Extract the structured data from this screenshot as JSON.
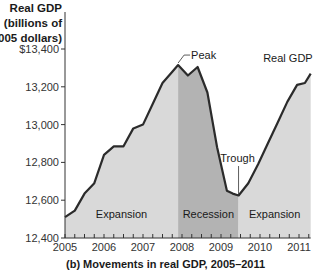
{
  "chart_data": {
    "type": "area",
    "title": "",
    "caption": "(b) Movements in real GDP, 2005–2011",
    "ylabel": [
      "Real GDP",
      "(billions of",
      "2005 dollars)"
    ],
    "xlabel": "",
    "ylim": [
      12400,
      13400
    ],
    "xlim": [
      2005,
      2011.3
    ],
    "yticks": [
      {
        "value": 13400,
        "label": "$13,400"
      },
      {
        "value": 13200,
        "label": "13,200"
      },
      {
        "value": 13000,
        "label": "13,000"
      },
      {
        "value": 12800,
        "label": "12,800"
      },
      {
        "value": 12600,
        "label": "12,600"
      },
      {
        "value": 12400,
        "label": "12,400"
      }
    ],
    "xticks": [
      {
        "value": 2005,
        "label": "2005"
      },
      {
        "value": 2006,
        "label": "2006"
      },
      {
        "value": 2007,
        "label": "2007"
      },
      {
        "value": 2008,
        "label": "2008"
      },
      {
        "value": 2009,
        "label": "2009"
      },
      {
        "value": 2010,
        "label": "2010"
      },
      {
        "value": 2011,
        "label": "2011"
      }
    ],
    "grid": false,
    "series": [
      {
        "name": "Real GDP",
        "x": [
          2005.0,
          2005.25,
          2005.5,
          2005.75,
          2006.0,
          2006.25,
          2006.5,
          2006.75,
          2007.0,
          2007.25,
          2007.5,
          2007.75,
          2007.9,
          2008.15,
          2008.4,
          2008.65,
          2008.9,
          2009.15,
          2009.3,
          2009.45,
          2009.7,
          2009.95,
          2010.2,
          2010.45,
          2010.7,
          2010.95,
          2011.15,
          2011.3
        ],
        "values": [
          12510,
          12545,
          12635,
          12690,
          12840,
          12885,
          12885,
          12980,
          13000,
          13110,
          13220,
          13280,
          13315,
          13260,
          13305,
          13170,
          12880,
          12650,
          12635,
          12625,
          12690,
          12790,
          12900,
          13010,
          13120,
          13210,
          13220,
          13270
        ]
      }
    ],
    "regions": [
      {
        "label": "Expansion",
        "from": 2005.0,
        "to": 2007.9,
        "color": "#d9d9d9"
      },
      {
        "label": "Recession",
        "from": 2007.9,
        "to": 2009.45,
        "color": "#b3b3b3"
      },
      {
        "label": "Expansion",
        "from": 2009.45,
        "to": 2011.3,
        "color": "#d9d9d9"
      }
    ],
    "annotations": [
      {
        "label": "Peak",
        "x": 2007.9,
        "value": 13315
      },
      {
        "label": "Trough",
        "x": 2009.45,
        "value": 12625
      },
      {
        "label": "Real GDP",
        "x": 2011.3,
        "value": 13270
      }
    ],
    "colors": {
      "line": "#2b2b2b",
      "expansion_fill": "#d9d9d9",
      "recession_fill": "#b3b3b3",
      "axis": "#333333"
    }
  }
}
